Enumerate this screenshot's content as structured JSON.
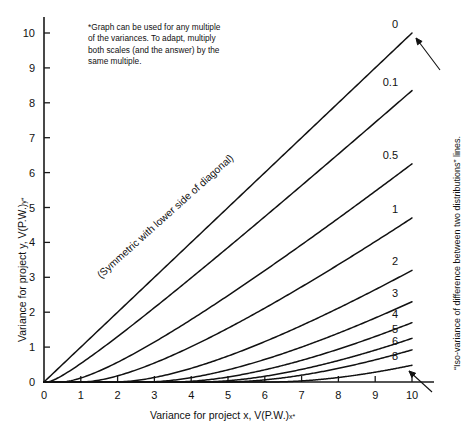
{
  "figure": {
    "footnote": "*Graph can be used for any multiple\nof the variances. To adapt, multiply\nboth scales (and the answer) by the\nsame multiple.",
    "diagonal_note": "(Symmetric with lower side of diagonal)",
    "right_annotation": "“Iso-variance of difference between two distributions” lines.",
    "ink_color": "#111111",
    "background_color": "#ffffff"
  },
  "chart_data": {
    "type": "line",
    "title": "",
    "xlabel": "Variance for project x, V(P.W.)x*",
    "ylabel": "Variance for project y, V(P.W.)y*",
    "xlabel_main": "Variance for project x, V(P.W.)",
    "xlabel_sub": "x",
    "xlabel_sup": "*",
    "ylabel_main": "Variance for project y, V(P.W.)",
    "ylabel_sub": "y",
    "ylabel_sup": "*",
    "xlim": [
      0,
      10
    ],
    "ylim": [
      0,
      10
    ],
    "xticks": [
      0,
      1,
      2,
      3,
      4,
      5,
      6,
      7,
      8,
      9,
      10
    ],
    "yticks": [
      0,
      1,
      2,
      3,
      4,
      5,
      6,
      7,
      8,
      9,
      10
    ],
    "grid": false,
    "legend": "inline-end-labels",
    "legend_position": "right edge of each curve",
    "series": [
      {
        "name": "0",
        "label": "0",
        "end_y": 10.0,
        "x": [
          0,
          1,
          2,
          3,
          4,
          5,
          6,
          7,
          8,
          9,
          10
        ],
        "values": [
          0.0,
          1.0,
          2.0,
          3.0,
          4.0,
          5.0,
          6.0,
          7.0,
          8.0,
          9.0,
          10.0
        ]
      },
      {
        "name": "0.1",
        "label": "0.1",
        "end_y": 8.35,
        "x": [
          0,
          1,
          2,
          3,
          4,
          5,
          6,
          7,
          8,
          9,
          10
        ],
        "values": [
          0.0,
          0.72,
          1.56,
          2.43,
          3.33,
          4.23,
          5.14,
          6.06,
          6.98,
          7.9,
          8.35
        ]
      },
      {
        "name": "0.5",
        "label": "0.5",
        "end_y": 6.25,
        "x": [
          0,
          1,
          2,
          3,
          4,
          5,
          6,
          7,
          8,
          9,
          10
        ],
        "values": [
          0.0,
          0.36,
          0.92,
          1.52,
          2.18,
          2.86,
          3.56,
          4.28,
          5.01,
          5.75,
          6.25
        ]
      },
      {
        "name": "1",
        "label": "1",
        "end_y": 4.7,
        "x": [
          0,
          1,
          2,
          3,
          4,
          5,
          6,
          7,
          8,
          9,
          10
        ],
        "values": [
          0.0,
          0.17,
          0.54,
          0.98,
          1.47,
          2.0,
          2.55,
          3.12,
          3.71,
          4.31,
          4.7
        ]
      },
      {
        "name": "2",
        "label": "2",
        "end_y": 3.2,
        "x": [
          0,
          1,
          2,
          3,
          4,
          5,
          6,
          7,
          8,
          9,
          10
        ],
        "values": [
          0.0,
          0.05,
          0.24,
          0.52,
          0.86,
          1.23,
          1.64,
          2.07,
          2.52,
          2.98,
          3.2
        ]
      },
      {
        "name": "3",
        "label": "3",
        "end_y": 2.3,
        "x": [
          0,
          1,
          2,
          3,
          4,
          5,
          6,
          7,
          8,
          9,
          10
        ],
        "values": [
          0.0,
          0.01,
          0.12,
          0.3,
          0.55,
          0.84,
          1.16,
          1.5,
          1.86,
          2.23,
          2.3
        ]
      },
      {
        "name": "4",
        "label": "4",
        "end_y": 1.7,
        "x": [
          0,
          1,
          2,
          3,
          4,
          5,
          6,
          7,
          8,
          9,
          10
        ],
        "values": [
          0.0,
          0.0,
          0.06,
          0.18,
          0.36,
          0.59,
          0.85,
          1.13,
          1.42,
          1.73,
          1.7
        ]
      },
      {
        "name": "5",
        "label": "5",
        "end_y": 1.25,
        "x": [
          0,
          1,
          2,
          3,
          4,
          5,
          6,
          7,
          8,
          9,
          10
        ],
        "values": [
          0.0,
          0.0,
          0.03,
          0.11,
          0.24,
          0.41,
          0.62,
          0.85,
          1.1,
          1.36,
          1.25
        ]
      },
      {
        "name": "6",
        "label": "6",
        "end_y": 0.92,
        "x": [
          0,
          1,
          2,
          3,
          4,
          5,
          6,
          7,
          8,
          9,
          10
        ],
        "values": [
          0.0,
          0.0,
          0.01,
          0.06,
          0.15,
          0.28,
          0.44,
          0.63,
          0.83,
          1.05,
          0.92
        ]
      },
      {
        "name": "8",
        "label": "8",
        "end_y": 0.48,
        "x": [
          0,
          1,
          2,
          3,
          4,
          5,
          6,
          7,
          8,
          9,
          10
        ],
        "values": [
          0.0,
          0.0,
          0.0,
          0.02,
          0.06,
          0.13,
          0.22,
          0.33,
          0.46,
          0.6,
          0.48
        ]
      }
    ]
  },
  "axes": {
    "x_tick_labels": [
      "0",
      "1",
      "2",
      "3",
      "4",
      "5",
      "6",
      "7",
      "8",
      "9",
      "10"
    ],
    "y_tick_labels": [
      "0",
      "1",
      "2",
      "3",
      "4",
      "5",
      "6",
      "7",
      "8",
      "9",
      "10"
    ]
  }
}
